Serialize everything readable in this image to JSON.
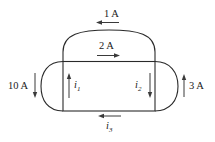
{
  "diagram": {
    "type": "circuit-current-network",
    "colors": {
      "wire": "#2a2a2a",
      "arrow": "#3a3a3a",
      "text": "#222222",
      "background": "#ffffff"
    },
    "labels": {
      "top_outer": "1 A",
      "top_inner": "2 A",
      "left_outer": "10 A",
      "right_outer": "3 A",
      "i1_main": "i",
      "i1_sub": "1",
      "i2_main": "i",
      "i2_sub": "2",
      "i3_main": "i",
      "i3_sub": "3"
    },
    "currents": [
      {
        "name": "top-outer-branch",
        "value": "1 A",
        "direction": "left"
      },
      {
        "name": "top-inner-branch",
        "value": "2 A",
        "direction": "right"
      },
      {
        "name": "left-outer-branch",
        "value": "10 A",
        "direction": "down"
      },
      {
        "name": "right-outer-branch",
        "value": "3 A",
        "direction": "up"
      },
      {
        "name": "left-vertical-branch",
        "value": "i1",
        "direction": "up"
      },
      {
        "name": "right-vertical-branch",
        "value": "i2",
        "direction": "down"
      },
      {
        "name": "bottom-branch",
        "value": "i3",
        "direction": "left"
      }
    ]
  }
}
